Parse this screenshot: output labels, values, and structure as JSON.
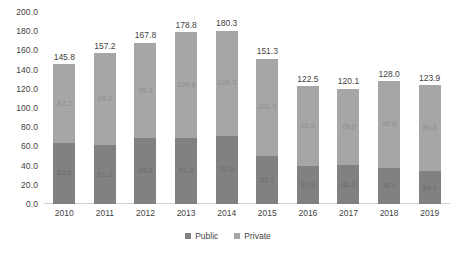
{
  "chart_data": {
    "type": "bar",
    "subtype": "stacked-column",
    "title": "",
    "subtitle": "",
    "xlabel": "",
    "ylabel": "",
    "categories": [
      "2010",
      "2011",
      "2012",
      "2013",
      "2014",
      "2015",
      "2016",
      "2017",
      "2018",
      "2019"
    ],
    "series": [
      {
        "name": "Public",
        "color": "#818181",
        "values": [
          63.6,
          61.2,
          68.5,
          69.2,
          71.0,
          50.2,
          39.9,
          40.2,
          38.0,
          34.1
        ]
      },
      {
        "name": "Private",
        "color": "#a6a6a6",
        "values": [
          82.2,
          96.0,
          99.3,
          109.6,
          109.3,
          101.1,
          82.6,
          79.9,
          90.0,
          89.8
        ]
      }
    ],
    "totals": [
      145.8,
      157.2,
      167.8,
      178.8,
      180.3,
      151.3,
      122.5,
      120.1,
      128.0,
      123.9
    ],
    "ylim": [
      0.0,
      200.0
    ],
    "ytick_step": 20.0,
    "ytick_labels": [
      "200.0",
      "180.0",
      "160.0",
      "140.0",
      "120.0",
      "100.0",
      "80.0",
      "60.0",
      "40.0",
      "20.0",
      "0.0"
    ],
    "ytick_values": [
      200.0,
      180.0,
      160.0,
      140.0,
      120.0,
      100.0,
      80.0,
      60.0,
      40.0,
      20.0,
      0.0
    ],
    "grid": false,
    "legend_position": "bottom",
    "data_labels": {
      "show_totals": true,
      "show_segments": true,
      "public": [
        "63.6",
        "61.2",
        "68.5",
        "69.2",
        "71.0",
        "50.2",
        "39.9",
        "40.2",
        "38.0",
        "34.1"
      ],
      "private": [
        "82.2",
        "96.0",
        "99.3",
        "109.6",
        "109.3",
        "101.1",
        "82.6",
        "79.9",
        "90.0",
        "89.8"
      ],
      "totals": [
        "145.8",
        "157.2",
        "167.8",
        "178.8",
        "180.3",
        "151.3",
        "122.5",
        "120.1",
        "128.0",
        "123.9"
      ]
    }
  },
  "legend": {
    "items": [
      {
        "label": "Public",
        "color": "#818181"
      },
      {
        "label": "Private",
        "color": "#a6a6a6"
      }
    ]
  }
}
